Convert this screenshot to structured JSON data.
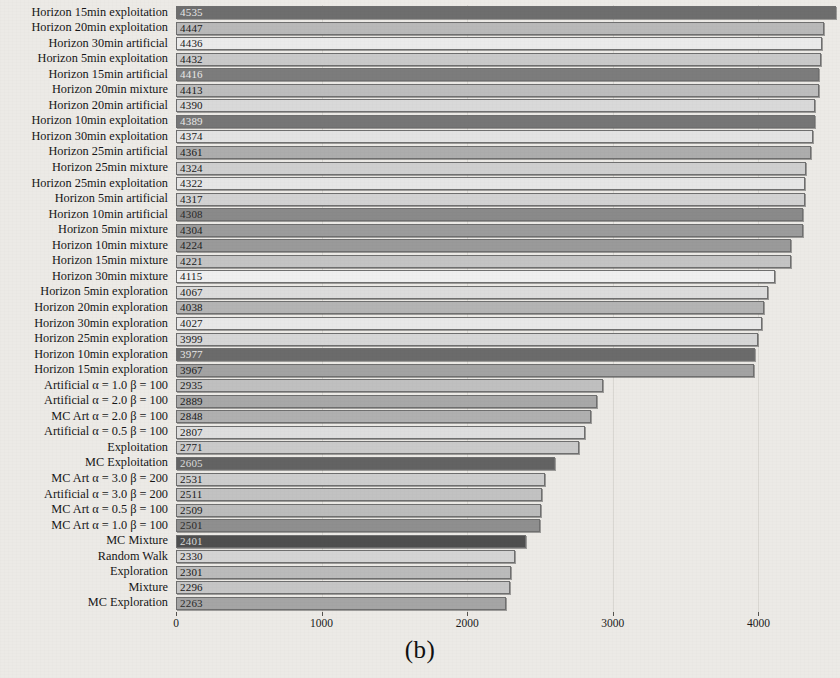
{
  "figure": {
    "caption": "(b)",
    "type": "horizontal-bar-chart"
  },
  "axis": {
    "ticks": [
      0,
      1000,
      2000,
      3000,
      4000
    ],
    "tick_labels": [
      "0",
      "1000",
      "2000",
      "3000",
      "4000"
    ],
    "xmin": 0,
    "xmax": 4560,
    "gridlines": [
      1000,
      2000,
      3000,
      4000
    ]
  },
  "chart_data": {
    "type": "bar",
    "orientation": "horizontal",
    "title": "",
    "xlabel": "",
    "ylabel": "",
    "xlim": [
      0,
      4560
    ],
    "grid": true,
    "legend": "none",
    "categories": [
      "Horizon 15min exploitation",
      "Horizon 20min exploitation",
      "Horizon 30min artificial",
      "Horizon 5min exploitation",
      "Horizon 15min artificial",
      "Horizon 20min mixture",
      "Horizon 20min artificial",
      "Horizon 10min exploitation",
      "Horizon 30min exploitation",
      "Horizon 25min artificial",
      "Horizon 25min mixture",
      "Horizon 25min exploitation",
      "Horizon 5min artificial",
      "Horizon 10min artificial",
      "Horizon 5min mixture",
      "Horizon 10min mixture",
      "Horizon 15min mixture",
      "Horizon 30min mixture",
      "Horizon 5min exploration",
      "Horizon 20min exploration",
      "Horizon 30min exploration",
      "Horizon 25min exploration",
      "Horizon 10min exploration",
      "Horizon 15min exploration",
      "Artificial α = 1.0 β = 100",
      "Artificial α = 2.0 β = 100",
      "MC Art α = 2.0 β = 100",
      "Artificial α = 0.5 β = 100",
      "Exploitation",
      "MC Exploitation",
      "MC Art α = 3.0 β = 200",
      "Artificial α = 3.0 β = 200",
      "MC Art α = 0.5 β = 100",
      "MC Art α = 1.0 β = 100",
      "MC Mixture",
      "Random Walk",
      "Exploration",
      "Mixture",
      "MC Exploration"
    ],
    "values": [
      4535,
      4447,
      4436,
      4432,
      4416,
      4413,
      4390,
      4389,
      4374,
      4361,
      4324,
      4322,
      4317,
      4308,
      4304,
      4224,
      4221,
      4115,
      4067,
      4038,
      4027,
      3999,
      3977,
      3967,
      2935,
      2889,
      2848,
      2807,
      2771,
      2605,
      2531,
      2511,
      2509,
      2501,
      2401,
      2330,
      2301,
      2296,
      2263
    ],
    "value_labels": [
      "4535",
      "4447",
      "4436",
      "4432",
      "4416",
      "4413",
      "4390",
      "4389",
      "4374",
      "4361",
      "4324",
      "4322",
      "4317",
      "4308",
      "4304",
      "4224",
      "4221",
      "4115",
      "4067",
      "4038",
      "4027",
      "3999",
      "3977",
      "3967",
      "2935",
      "2889",
      "2848",
      "2807",
      "2771",
      "2605",
      "2531",
      "2511",
      "2509",
      "2501",
      "2401",
      "2330",
      "2301",
      "2296",
      "2263"
    ],
    "bar_colors": [
      "#6e6e6e",
      "#b9b9b9",
      "#ebebeb",
      "#c9c9c9",
      "#7c7c7c",
      "#bdbdbd",
      "#d9d9d9",
      "#767676",
      "#e3e3e3",
      "#adadad",
      "#cfcfcf",
      "#e6e6e6",
      "#d2d2d2",
      "#8a8a8a",
      "#9c9c9c",
      "#9a9a9a",
      "#c4c4c4",
      "#efefef",
      "#dcdcdc",
      "#b4b4b4",
      "#e8e8e8",
      "#d6d6d6",
      "#6b6b6b",
      "#a3a3a3",
      "#c0c0c0",
      "#a8a8a8",
      "#b0b0b0",
      "#dedede",
      "#cacaca",
      "#636363",
      "#cdcdcd",
      "#c2c2c2",
      "#bcbcbc",
      "#8f8f8f",
      "#4f4f4f",
      "#d4d4d4",
      "#bbbbbb",
      "#c6c6c6",
      "#a5a5a5"
    ],
    "value_label_colors": [
      "#e8e8e8",
      "#1a1a1a",
      "#1a1a1a",
      "#1a1a1a",
      "#e8e8e8",
      "#1a1a1a",
      "#1a1a1a",
      "#e8e8e8",
      "#1a1a1a",
      "#1a1a1a",
      "#1a1a1a",
      "#1a1a1a",
      "#1a1a1a",
      "#2a2a2a",
      "#1f1f1f",
      "#1f1f1f",
      "#1a1a1a",
      "#1a1a1a",
      "#1a1a1a",
      "#1a1a1a",
      "#1a1a1a",
      "#1a1a1a",
      "#e8e8e8",
      "#1a1a1a",
      "#1a1a1a",
      "#1a1a1a",
      "#1a1a1a",
      "#1a1a1a",
      "#1a1a1a",
      "#dcdcdc",
      "#1a1a1a",
      "#1a1a1a",
      "#1a1a1a",
      "#2a2a2a",
      "#d8d8d8",
      "#1a1a1a",
      "#1a1a1a",
      "#1a1a1a",
      "#2a2a2a"
    ]
  }
}
